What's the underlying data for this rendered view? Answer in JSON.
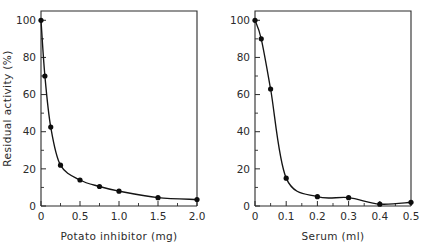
{
  "figure": {
    "background": "#ffffff",
    "ink_color": "#1a1a1a",
    "panel_count": 2
  },
  "chart_data": [
    {
      "type": "line",
      "panel": "left",
      "title": "",
      "xlabel": "Potato inhibitor (mg)",
      "ylabel": "Residual activity (%)",
      "xlim": [
        0,
        2.0
      ],
      "ylim": [
        0,
        105
      ],
      "grid": false,
      "legend": "none",
      "marker": "filled-circle",
      "xticks": [
        0,
        0.5,
        1.0,
        1.5,
        2.0
      ],
      "xticklabels": [
        "0",
        "0.5",
        "1.0",
        "1.5",
        "2.0"
      ],
      "xminorticks": [
        0.25,
        0.75,
        1.25,
        1.75
      ],
      "yticks": [
        0,
        20,
        40,
        60,
        80,
        100
      ],
      "yticklabels": [
        "0",
        "20",
        "40",
        "60",
        "80",
        "100"
      ],
      "yminorticks": [
        10,
        30,
        50,
        70,
        90
      ],
      "x": [
        0,
        0.05,
        0.125,
        0.25,
        0.5,
        0.75,
        1.0,
        1.5,
        2.0
      ],
      "y": [
        100,
        70,
        42.5,
        22,
        14,
        10.5,
        8,
        4.5,
        3.5
      ]
    },
    {
      "type": "line",
      "panel": "right",
      "title": "",
      "xlabel": "Serum (ml)",
      "ylabel": "",
      "xlim": [
        0,
        0.5
      ],
      "ylim": [
        0,
        105
      ],
      "grid": false,
      "legend": "none",
      "marker": "filled-circle",
      "xticks": [
        0,
        0.1,
        0.2,
        0.3,
        0.4,
        0.5
      ],
      "xticklabels": [
        "0",
        "0.1",
        "0.2",
        "0.3",
        "0.4",
        "0.5"
      ],
      "xminorticks": [
        0.05,
        0.15,
        0.25,
        0.35,
        0.45
      ],
      "yticks": [
        0,
        20,
        40,
        60,
        80,
        100
      ],
      "yticklabels": [
        "0",
        "20",
        "40",
        "60",
        "80",
        "100"
      ],
      "yminorticks": [
        10,
        30,
        50,
        70,
        90
      ],
      "x": [
        0,
        0.02,
        0.05,
        0.1,
        0.2,
        0.3,
        0.4,
        0.5
      ],
      "y": [
        100,
        90,
        63,
        15,
        5,
        4.5,
        1,
        2
      ]
    }
  ]
}
